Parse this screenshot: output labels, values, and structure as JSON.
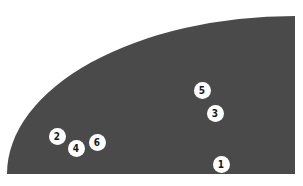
{
  "diagram": {
    "shape": "quarter-ellipse field",
    "fill_color": "#4a4a4a",
    "marker_color": "#ffffff",
    "markers": [
      {
        "label": "1",
        "x": 221,
        "y": 164
      },
      {
        "label": "2",
        "x": 57,
        "y": 136
      },
      {
        "label": "3",
        "x": 215,
        "y": 113
      },
      {
        "label": "4",
        "x": 76,
        "y": 148
      },
      {
        "label": "5",
        "x": 202,
        "y": 90
      },
      {
        "label": "6",
        "x": 97,
        "y": 142
      }
    ]
  }
}
